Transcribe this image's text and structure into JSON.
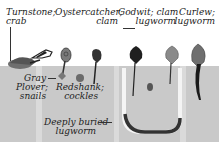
{
  "diagram": {
    "colors": {
      "mud": "#c9c9c9",
      "mud_light_stripe": "#dadada",
      "bird_dark": "#2b2b2b",
      "bird_mid": "#6f6f6f",
      "bird_light": "#8a8a8a",
      "background": "#ffffff"
    },
    "labels": {
      "turnstone": [
        "Turnstone;",
        "crab"
      ],
      "oystercatcher": [
        "Oystercatcher;",
        "clam"
      ],
      "godwit": [
        "Godwit; clam",
        "lugworm"
      ],
      "curlew": [
        "Curlew;",
        "lugworm"
      ],
      "gray_plover": [
        "Gray",
        "Plover;",
        "snails"
      ],
      "redshank": [
        "Redshank;",
        "cockles"
      ],
      "lugworm": [
        "Deeply buried",
        "lugworm"
      ]
    }
  }
}
